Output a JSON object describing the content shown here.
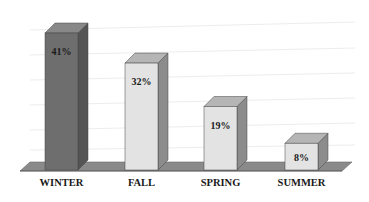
{
  "chart_data": {
    "type": "bar",
    "style": "3d-column",
    "title": "",
    "xlabel": "",
    "ylabel": "",
    "categories": [
      "WINTER",
      "FALL",
      "SPRING",
      "SUMMER"
    ],
    "values": [
      41,
      32,
      19,
      8
    ],
    "value_labels": [
      "41%",
      "32%",
      "19%",
      "8%"
    ],
    "unit": "%",
    "ylim": [
      0,
      45
    ],
    "grid": true,
    "legend": null
  },
  "colors": {
    "winter_front": "#6e6e6e",
    "winter_side": "#555555",
    "winter_top": "#888888",
    "light_front": "#e3e3e3",
    "light_side": "#8c8c8c",
    "light_top": "#b5b5b5",
    "floor": "#8a8a8a",
    "floor_edge": "#6a6a6a"
  }
}
